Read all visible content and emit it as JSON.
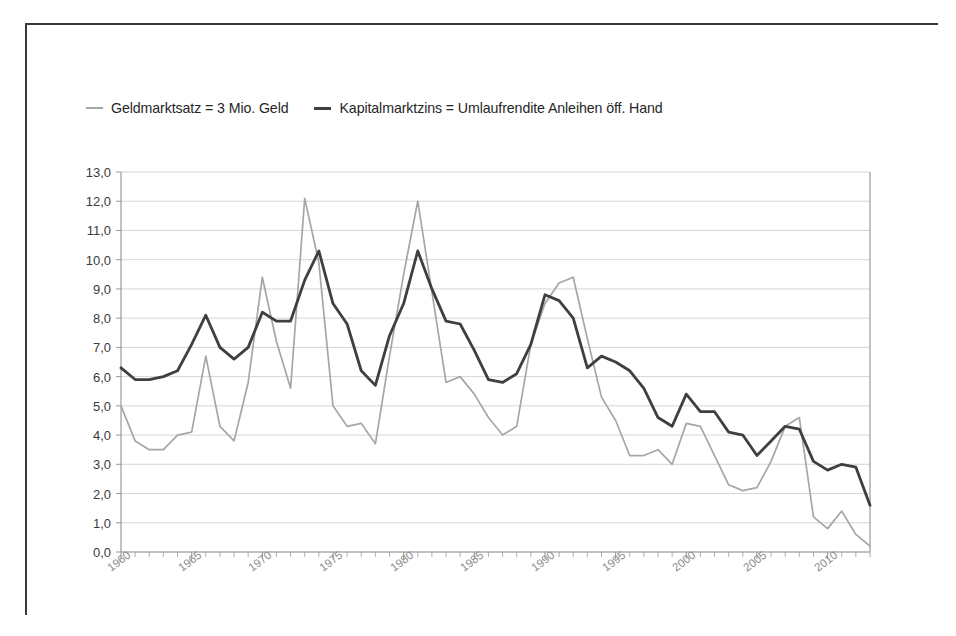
{
  "legend": {
    "items": [
      {
        "label": "Geldmarktsatz = 3 Mio. Geld",
        "color": "#a6a6a6",
        "key": "geldmarktsatz"
      },
      {
        "label": "Kapitalmarktzins = Umlaufrendite Anleihen öff. Hand",
        "color": "#3f3f3f",
        "key": "kapitalmarktzins"
      }
    ]
  },
  "chart_data": {
    "type": "line",
    "title": "",
    "xlabel": "",
    "ylabel": "",
    "xlim": [
      1960,
      2013
    ],
    "ylim": [
      0.0,
      13.0
    ],
    "ytick_labels": [
      "0,0",
      "1,0",
      "2,0",
      "3,0",
      "4,0",
      "5,0",
      "6,0",
      "7,0",
      "8,0",
      "9,0",
      "10,0",
      "11,0",
      "12,0",
      "13,0"
    ],
    "ytick_values": [
      0,
      1,
      2,
      3,
      4,
      5,
      6,
      7,
      8,
      9,
      10,
      11,
      12,
      13
    ],
    "xtick_labels": [
      "1960",
      "1965",
      "1970",
      "1975",
      "1980",
      "1985",
      "1990",
      "1995",
      "2000",
      "2005",
      "2010"
    ],
    "xtick_values": [
      1960,
      1965,
      1970,
      1975,
      1980,
      1985,
      1990,
      1995,
      2000,
      2005,
      2010
    ],
    "minor_xticks_every": 1,
    "grid": "horizontal",
    "legend_position": "above-plot",
    "x": [
      1960,
      1961,
      1962,
      1963,
      1964,
      1965,
      1966,
      1967,
      1968,
      1969,
      1970,
      1971,
      1972,
      1973,
      1974,
      1975,
      1976,
      1977,
      1978,
      1979,
      1980,
      1981,
      1982,
      1983,
      1984,
      1985,
      1986,
      1987,
      1988,
      1989,
      1990,
      1991,
      1992,
      1993,
      1994,
      1995,
      1996,
      1997,
      1998,
      1999,
      2000,
      2001,
      2002,
      2003,
      2004,
      2005,
      2006,
      2007,
      2008,
      2009,
      2010,
      2011,
      2012,
      2013
    ],
    "series": [
      {
        "name": "Geldmarktsatz = 3 Mio. Geld",
        "key": "geldmarktsatz",
        "color": "#a6a6a6",
        "width": 1.7,
        "values": [
          5.0,
          3.8,
          3.5,
          3.5,
          4.0,
          4.1,
          6.7,
          4.3,
          3.8,
          5.8,
          9.4,
          7.2,
          5.6,
          12.1,
          9.9,
          5.0,
          4.3,
          4.4,
          3.7,
          6.7,
          9.5,
          12.0,
          8.9,
          5.8,
          6.0,
          5.4,
          4.6,
          4.0,
          4.3,
          7.1,
          8.5,
          9.2,
          9.4,
          7.3,
          5.3,
          4.5,
          3.3,
          3.3,
          3.5,
          3.0,
          4.4,
          4.3,
          3.3,
          2.3,
          2.1,
          2.2,
          3.1,
          4.3,
          4.6,
          1.2,
          0.8,
          1.4,
          0.6,
          0.2
        ]
      },
      {
        "name": "Kapitalmarktzins = Umlaufrendite Anleihen öff. Hand",
        "key": "kapitalmarktzins",
        "color": "#3f3f3f",
        "width": 2.8,
        "values": [
          6.3,
          5.9,
          5.9,
          6.0,
          6.2,
          7.1,
          8.1,
          7.0,
          6.6,
          7.0,
          8.2,
          7.9,
          7.9,
          9.3,
          10.3,
          8.5,
          7.8,
          6.2,
          5.7,
          7.4,
          8.5,
          10.3,
          9.0,
          7.9,
          7.8,
          6.9,
          5.9,
          5.8,
          6.1,
          7.1,
          8.8,
          8.6,
          8.0,
          6.3,
          6.7,
          6.5,
          6.2,
          5.6,
          4.6,
          4.3,
          5.4,
          4.8,
          4.8,
          4.1,
          4.0,
          3.3,
          3.8,
          4.3,
          4.2,
          3.1,
          2.8,
          3.0,
          2.9,
          1.6
        ]
      }
    ]
  }
}
